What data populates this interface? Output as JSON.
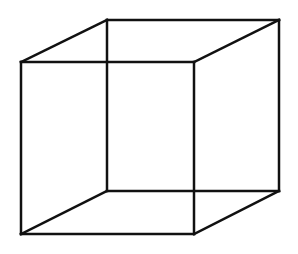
{
  "figure": {
    "type": "wireframe-cube",
    "stroke_color": "#111111",
    "background_color": "#ffffff",
    "stroke_width": 2.5
  },
  "vertices": {
    "front_top_left": [
      21,
      62
    ],
    "front_top_right": [
      194,
      62
    ],
    "front_bottom_left": [
      21,
      234
    ],
    "front_bottom_right": [
      194,
      234
    ],
    "back_top_left": [
      107,
      20
    ],
    "back_top_right": [
      279,
      20
    ],
    "back_bottom_left": [
      107,
      191
    ],
    "back_bottom_right": [
      279,
      191
    ]
  },
  "edges": [
    [
      "front_top_left",
      "front_top_right"
    ],
    [
      "front_top_right",
      "front_bottom_right"
    ],
    [
      "front_bottom_right",
      "front_bottom_left"
    ],
    [
      "front_bottom_left",
      "front_top_left"
    ],
    [
      "back_top_left",
      "back_top_right"
    ],
    [
      "back_top_right",
      "back_bottom_right"
    ],
    [
      "back_bottom_right",
      "back_bottom_left"
    ],
    [
      "back_bottom_left",
      "back_top_left"
    ],
    [
      "front_top_left",
      "back_top_left"
    ],
    [
      "front_top_right",
      "back_top_right"
    ],
    [
      "front_bottom_left",
      "back_bottom_left"
    ],
    [
      "front_bottom_right",
      "back_bottom_right"
    ]
  ]
}
